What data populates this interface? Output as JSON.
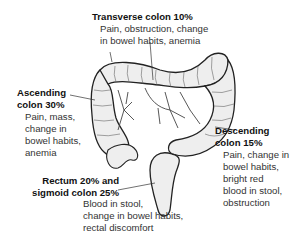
{
  "diagram": {
    "labels": {
      "transverse": {
        "title": "Transverse colon 10%",
        "desc_lines": [
          "Pain, obstruction, change",
          "in bowel habits, anemia"
        ]
      },
      "ascending": {
        "title_lines": [
          "Ascending",
          "colon 30%"
        ],
        "desc_lines": [
          "Pain, mass,",
          "change in",
          "bowel habits,",
          "anemia"
        ]
      },
      "descending": {
        "title_lines": [
          "Descending",
          "colon 15%"
        ],
        "desc_lines": [
          "Pain, change in",
          "bowel habits,",
          "bright red",
          "blood in stool,",
          "obstruction"
        ]
      },
      "rectum_sigmoid": {
        "title_lines": [
          "Rectum 20% and",
          "sigmoid colon 25%"
        ],
        "desc_lines": [
          "Blood in stool,",
          "change in bowel habits,",
          "rectal discomfort"
        ]
      }
    },
    "colors": {
      "outline": "#222222",
      "fill": "#eeeeee",
      "vessels": "#444444"
    }
  }
}
